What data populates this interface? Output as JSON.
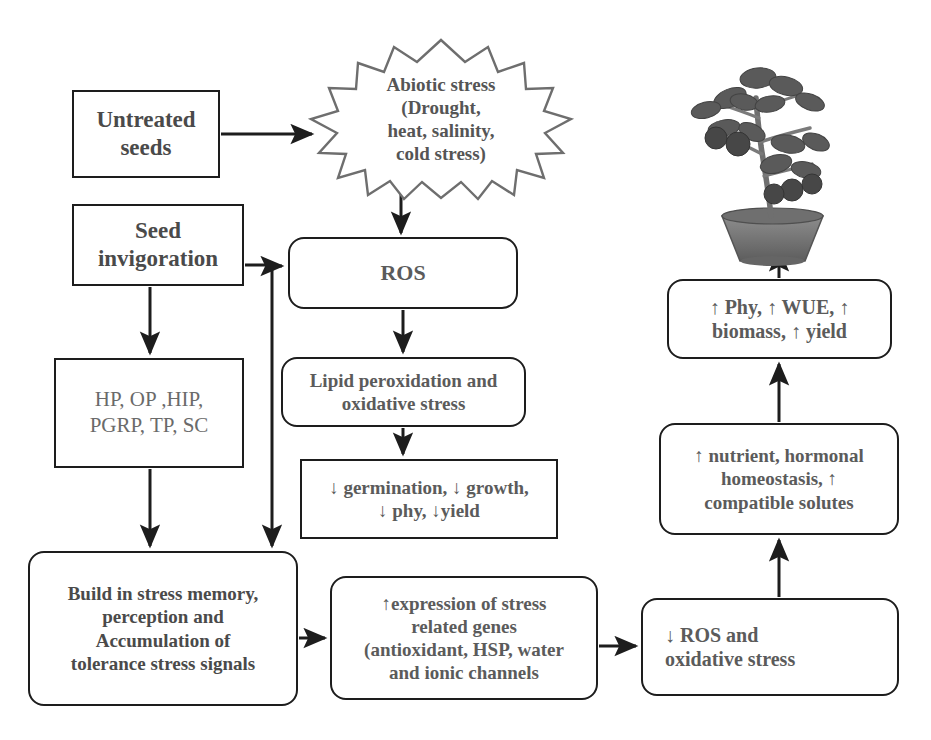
{
  "diagram": {
    "colors": {
      "box_border": "#1d1d1d",
      "text": "#555555",
      "arrow": "#1d1d1d",
      "burst_border": "#6e6e6e",
      "background": "#ffffff"
    }
  },
  "nodes": {
    "untreated_seeds": {
      "label": "Untreated\nseeds",
      "shape": "rectangle"
    },
    "seed_invigoration": {
      "label": "Seed\ninvigoration",
      "shape": "rectangle"
    },
    "abiotic_stress": {
      "label": "Abiotic stress\n(Drought,\nheat, salinity,\ncold stress)",
      "shape": "starburst"
    },
    "treatments": {
      "label": "HP, OP ,HIP,\nPGRP, TP, SC",
      "shape": "rectangle"
    },
    "ros": {
      "label": "ROS",
      "shape": "rounded-rectangle"
    },
    "lipid_peroxidation": {
      "label": "Lipid peroxidation and\noxidative stress",
      "shape": "rounded-rectangle"
    },
    "reduced_traits": {
      "label": "↓ germination, ↓ growth,\n↓ phy, ↓yield",
      "shape": "rectangle"
    },
    "stress_memory": {
      "label": "Build in stress memory,\nperception and\nAccumulation of\ntolerance stress signals",
      "shape": "rounded-rectangle"
    },
    "gene_expression": {
      "label": "↑expression of stress\nrelated genes\n(antioxidant, HSP, water\nand ionic channels",
      "shape": "rounded-rectangle"
    },
    "reduced_ros": {
      "label": "↓ ROS and\noxidative stress",
      "shape": "rounded-rectangle"
    },
    "homeostasis": {
      "label": "↑ nutrient, hormonal\nhomeostasis, ↑\ncompatible solutes",
      "shape": "rounded-rectangle"
    },
    "improved_traits": {
      "label": "↑ Phy, ↑ WUE, ↑\nbiomass, ↑ yield",
      "shape": "rounded-rectangle"
    },
    "plant_image": {
      "label": "potted tomato plant with fruit"
    }
  },
  "edges": [
    {
      "from": "untreated_seeds",
      "to": "abiotic_stress",
      "direction": "right"
    },
    {
      "from": "abiotic_stress",
      "to": "ros",
      "direction": "down"
    },
    {
      "from": "seed_invigoration",
      "to": "ros",
      "direction": "right"
    },
    {
      "from": "seed_invigoration",
      "to": "treatments",
      "direction": "down"
    },
    {
      "from": "seed_invigoration",
      "to": "stress_memory",
      "direction": "down"
    },
    {
      "from": "treatments",
      "to": "stress_memory",
      "direction": "down"
    },
    {
      "from": "ros",
      "to": "lipid_peroxidation",
      "direction": "down"
    },
    {
      "from": "lipid_peroxidation",
      "to": "reduced_traits",
      "direction": "down"
    },
    {
      "from": "stress_memory",
      "to": "gene_expression",
      "direction": "right"
    },
    {
      "from": "gene_expression",
      "to": "reduced_ros",
      "direction": "right"
    },
    {
      "from": "reduced_ros",
      "to": "homeostasis",
      "direction": "up"
    },
    {
      "from": "homeostasis",
      "to": "improved_traits",
      "direction": "up"
    },
    {
      "from": "improved_traits",
      "to": "plant_image",
      "direction": "up"
    }
  ]
}
